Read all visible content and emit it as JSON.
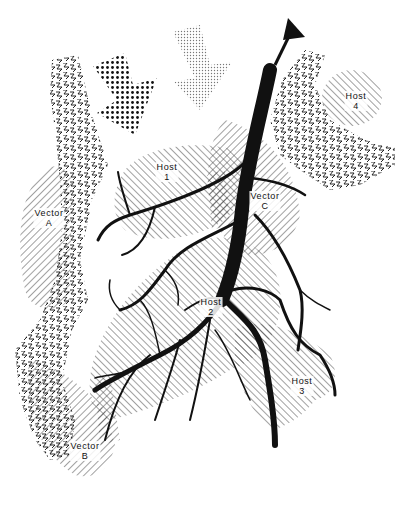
{
  "diagram": {
    "type": "host-vector dispersal network",
    "colors": {
      "ink": "#111111",
      "background": "#ffffff",
      "hatch": "#444444",
      "dots_dark": "#111111",
      "dots_light": "#777777"
    },
    "regions": {
      "host1": {
        "name": "Host",
        "id": "1"
      },
      "host2": {
        "name": "Host",
        "id": "2"
      },
      "host3": {
        "name": "Host",
        "id": "3"
      },
      "host4": {
        "name": "Host",
        "id": "4"
      },
      "vectorA": {
        "name": "Vector",
        "id": "A"
      },
      "vectorB": {
        "name": "Vector",
        "id": "B"
      },
      "vectorC": {
        "name": "Vector",
        "id": "C"
      }
    },
    "elements": [
      "branching-trunk-network",
      "exit-arrow-top",
      "dark-dotted-arrow",
      "light-dotted-arrow",
      "zigzag-band-left",
      "zigzag-band-right"
    ]
  }
}
